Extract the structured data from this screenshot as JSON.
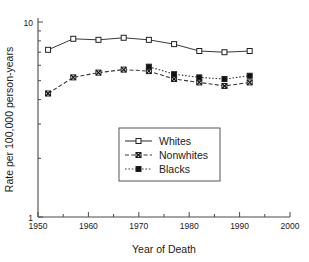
{
  "chart_data": {
    "type": "line",
    "title": "",
    "xlabel": "Year of Death",
    "ylabel": "Rate per 100,000 person-years",
    "xlim": [
      1950,
      2000
    ],
    "ylim": [
      1,
      10
    ],
    "yscale": "log",
    "grid": false,
    "legend_position": "center",
    "x_ticks": [
      1950,
      1960,
      1970,
      1980,
      1990,
      2000
    ],
    "x_tick_labels": [
      "1950",
      "1960",
      "1970",
      "1980",
      "1990",
      "2000"
    ],
    "x_minor_ticks": [
      1955,
      1965,
      1975,
      1985,
      1995
    ],
    "y_ticks": [
      1,
      10
    ],
    "y_tick_labels": [
      "1",
      "10"
    ],
    "y_minor_ticks": [
      2,
      3,
      4,
      5,
      6,
      7,
      8,
      9
    ],
    "series": [
      {
        "name": "Whites",
        "marker": "open-square",
        "linestyle": "solid",
        "x": [
          1952,
          1957,
          1962,
          1967,
          1972,
          1977,
          1982,
          1987,
          1992
        ],
        "values": [
          7.2,
          8.2,
          8.1,
          8.3,
          8.1,
          7.7,
          7.1,
          7.0,
          7.1
        ]
      },
      {
        "name": "Nonwhites",
        "marker": "crosshatch-square",
        "linestyle": "dashed",
        "x": [
          1952,
          1957,
          1962,
          1967,
          1972,
          1977,
          1982,
          1987,
          1992
        ],
        "values": [
          4.3,
          5.2,
          5.5,
          5.7,
          5.6,
          5.1,
          4.9,
          4.7,
          4.9
        ]
      },
      {
        "name": "Blacks",
        "marker": "filled-square",
        "linestyle": "dotted",
        "x": [
          1972,
          1977,
          1982,
          1987,
          1992
        ],
        "values": [
          5.9,
          5.4,
          5.2,
          5.1,
          5.3
        ]
      }
    ]
  },
  "legend": {
    "items": [
      {
        "label": "Whites"
      },
      {
        "label": "Nonwhites"
      },
      {
        "label": "Blacks"
      }
    ]
  },
  "axis": {
    "x_title": "Year of Death",
    "y_title": "Rate per 100,000 person-years"
  }
}
